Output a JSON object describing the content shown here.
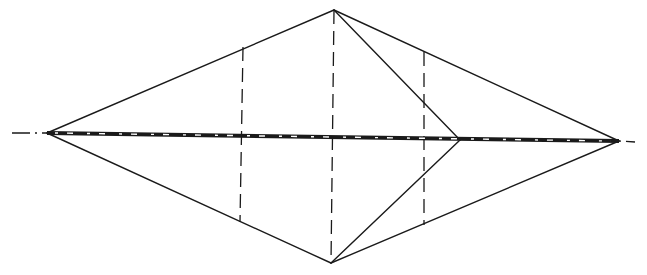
{
  "diagram": {
    "stroke_color": "#1a1a1a",
    "background": "#ffffff",
    "points": {
      "left_tip": [
        47,
        133
      ],
      "right_tip": [
        619,
        141
      ],
      "top_apex": [
        334,
        10
      ],
      "bottom_apex": [
        331,
        263
      ],
      "inner_vertex": [
        460,
        140
      ],
      "upper_left_section": [
        243,
        47
      ],
      "lower_left_section": [
        240,
        222
      ],
      "upper_right_section": [
        424,
        52
      ],
      "lower_right_section": [
        424,
        225
      ]
    },
    "outline_segments": [
      {
        "name": "left-upper-edge",
        "from": "left_tip",
        "to": "top_apex"
      },
      {
        "name": "left-lower-edge",
        "from": "left_tip",
        "to": "bottom_apex"
      },
      {
        "name": "right-upper-edge",
        "from": "top_apex",
        "to": "right_tip"
      },
      {
        "name": "right-lower-edge",
        "from": "bottom_apex",
        "to": "right_tip"
      },
      {
        "name": "inner-upper-edge",
        "from": "top_apex",
        "to": "inner_vertex"
      },
      {
        "name": "inner-lower-edge",
        "from": "inner_vertex",
        "to": "bottom_apex"
      }
    ],
    "dashed_segments": [
      {
        "name": "center-vertical-dashed",
        "from": "top_apex",
        "to": "bottom_apex"
      },
      {
        "name": "left-section-dashed",
        "from": "upper_left_section",
        "to": "lower_left_section"
      },
      {
        "name": "right-section-dashed",
        "from": "upper_right_section",
        "to": "lower_right_section"
      }
    ],
    "axis": {
      "name": "horizontal-center-axis",
      "from": [
        12,
        133
      ],
      "to": [
        635,
        142
      ],
      "style": "dash-dot thick"
    }
  }
}
